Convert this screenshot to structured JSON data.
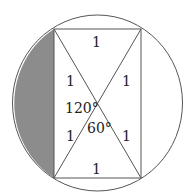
{
  "diagram": {
    "colors": {
      "stroke": "#555555",
      "shade": "#8c8c8c",
      "background": "#ffffff"
    },
    "labels": {
      "top_side": "1",
      "bottom_side": "1",
      "upper_left_half_diagonal": "1",
      "upper_right_half_diagonal": "1",
      "lower_left_half_diagonal": "1",
      "lower_right_half_diagonal": "1",
      "angle_obtuse": "120°",
      "angle_acute": "60°"
    }
  }
}
